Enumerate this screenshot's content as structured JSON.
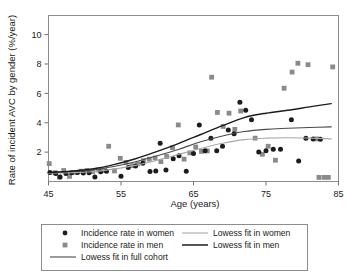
{
  "chart_data": {
    "type": "scatter",
    "title": "",
    "xlabel": "Age (years)",
    "ylabel": "Rate of incident AVC by gender (%/year)",
    "xlim": [
      45,
      85
    ],
    "ylim": [
      0,
      11.3
    ],
    "xticks": [
      45,
      55,
      65,
      75,
      85
    ],
    "yticks": [
      2,
      4,
      6,
      8,
      10
    ],
    "xtick_labels": [
      "45",
      "55",
      "65",
      "75",
      "85"
    ],
    "ytick_labels": [
      "2",
      "4",
      "6",
      "8",
      "10"
    ],
    "grid": false,
    "legend_position": "below-plot",
    "colors": {
      "women_marker": "#1c1c1c",
      "men_marker": "#8a8a8a",
      "women_fit": "#a9a9a9",
      "men_fit": "#1c1c1c",
      "full_cohort_fit": "#4a4a4a",
      "frame": "#8c8c93",
      "background": "#ffffff"
    },
    "series": [
      {
        "name": "Incidence rate in women",
        "type": "scatter",
        "marker": "circle",
        "color": "#1c1c1c",
        "points": [
          [
            45.2,
            0.62
          ],
          [
            46.0,
            0.55
          ],
          [
            46.6,
            0.3
          ],
          [
            47.4,
            0.55
          ],
          [
            48.2,
            0.6
          ],
          [
            49.0,
            0.62
          ],
          [
            49.8,
            0.58
          ],
          [
            50.6,
            0.6
          ],
          [
            51.4,
            0.3
          ],
          [
            52.2,
            0.66
          ],
          [
            53.0,
            0.7
          ],
          [
            55.0,
            0.35
          ],
          [
            56.0,
            0.95
          ],
          [
            57.0,
            1.05
          ],
          [
            58.0,
            1.25
          ],
          [
            59.0,
            0.68
          ],
          [
            59.8,
            0.72
          ],
          [
            60.4,
            2.6
          ],
          [
            61.2,
            0.78
          ],
          [
            62.2,
            1.55
          ],
          [
            63.0,
            1.75
          ],
          [
            64.0,
            0.7
          ],
          [
            65.0,
            1.9
          ],
          [
            65.8,
            3.85
          ],
          [
            66.6,
            2.1
          ],
          [
            67.4,
            2.95
          ],
          [
            68.2,
            2.1
          ],
          [
            69.0,
            2.4
          ],
          [
            69.8,
            3.5
          ],
          [
            70.6,
            3.25
          ],
          [
            71.4,
            5.4
          ],
          [
            72.2,
            4.85
          ],
          [
            73.0,
            4.2
          ],
          [
            74.0,
            2.0
          ],
          [
            75.0,
            2.1
          ],
          [
            76.0,
            2.2
          ],
          [
            77.0,
            2.2
          ],
          [
            78.5,
            4.2
          ],
          [
            79.5,
            1.4
          ],
          [
            80.5,
            2.95
          ],
          [
            81.5,
            2.9
          ],
          [
            82.5,
            2.88
          ]
        ]
      },
      {
        "name": "Incidence rate in men",
        "type": "scatter",
        "marker": "square",
        "color": "#8a8a8a",
        "points": [
          [
            45.1,
            1.22
          ],
          [
            45.9,
            0.6
          ],
          [
            46.5,
            0.3
          ],
          [
            47.1,
            0.75
          ],
          [
            47.9,
            0.35
          ],
          [
            48.7,
            0.62
          ],
          [
            49.5,
            0.7
          ],
          [
            50.3,
            0.75
          ],
          [
            51.1,
            0.68
          ],
          [
            51.9,
            0.78
          ],
          [
            52.7,
            0.75
          ],
          [
            53.3,
            2.4
          ],
          [
            54.1,
            0.72
          ],
          [
            54.9,
            1.58
          ],
          [
            55.7,
            1.3
          ],
          [
            56.5,
            1.08
          ],
          [
            57.3,
            1.2
          ],
          [
            58.1,
            1.42
          ],
          [
            58.9,
            1.52
          ],
          [
            59.7,
            1.6
          ],
          [
            60.5,
            1.35
          ],
          [
            61.3,
            1.7
          ],
          [
            62.1,
            2.3
          ],
          [
            62.9,
            3.85
          ],
          [
            63.7,
            1.52
          ],
          [
            64.5,
            1.95
          ],
          [
            65.3,
            2.35
          ],
          [
            66.1,
            2.05
          ],
          [
            66.9,
            2.08
          ],
          [
            67.5,
            7.1
          ],
          [
            68.3,
            4.7
          ],
          [
            69.1,
            3.75
          ],
          [
            69.9,
            4.65
          ],
          [
            70.7,
            3.55
          ],
          [
            71.5,
            4.8
          ],
          [
            73.5,
            2.95
          ],
          [
            74.5,
            1.85
          ],
          [
            75.3,
            2.4
          ],
          [
            76.3,
            1.45
          ],
          [
            77.5,
            6.35
          ],
          [
            78.6,
            7.45
          ],
          [
            79.4,
            8.05
          ],
          [
            80.8,
            7.95
          ],
          [
            82.0,
            2.9
          ],
          [
            82.3,
            0.28
          ],
          [
            83.0,
            0.28
          ],
          [
            83.6,
            0.28
          ],
          [
            84.2,
            7.8
          ]
        ]
      },
      {
        "name": "Lowess fit in women",
        "type": "line",
        "color": "#a9a9a9",
        "points": [
          [
            45,
            0.58
          ],
          [
            48,
            0.6
          ],
          [
            51,
            0.66
          ],
          [
            54,
            0.85
          ],
          [
            57,
            1.1
          ],
          [
            60,
            1.45
          ],
          [
            63,
            1.85
          ],
          [
            66,
            2.25
          ],
          [
            69,
            2.6
          ],
          [
            72,
            2.85
          ],
          [
            75,
            2.95
          ],
          [
            78,
            2.98
          ],
          [
            81,
            2.95
          ],
          [
            84,
            2.9
          ]
        ]
      },
      {
        "name": "Lowess fit in men",
        "type": "line",
        "color": "#1c1c1c",
        "points": [
          [
            45,
            0.62
          ],
          [
            48,
            0.7
          ],
          [
            51,
            0.85
          ],
          [
            54,
            1.15
          ],
          [
            57,
            1.55
          ],
          [
            60,
            2.05
          ],
          [
            63,
            2.6
          ],
          [
            66,
            3.2
          ],
          [
            69,
            3.8
          ],
          [
            72,
            4.35
          ],
          [
            75,
            4.65
          ],
          [
            78,
            4.85
          ],
          [
            81,
            5.08
          ],
          [
            84,
            5.3
          ]
        ]
      },
      {
        "name": "Lowess fit in full cohort",
        "type": "line",
        "color": "#4a4a4a",
        "points": [
          [
            45,
            0.6
          ],
          [
            48,
            0.66
          ],
          [
            51,
            0.78
          ],
          [
            54,
            1.02
          ],
          [
            57,
            1.35
          ],
          [
            60,
            1.75
          ],
          [
            63,
            2.2
          ],
          [
            66,
            2.7
          ],
          [
            69,
            3.1
          ],
          [
            72,
            3.4
          ],
          [
            75,
            3.55
          ],
          [
            78,
            3.62
          ],
          [
            81,
            3.68
          ],
          [
            84,
            3.72
          ]
        ]
      }
    ]
  },
  "axes": {
    "y_title": "Rate of incident AVC by gender (%/year)",
    "x_title": "Age (years)"
  },
  "legend": {
    "entries": [
      {
        "label": "Incidence rate in women",
        "glyph": "circle-marker",
        "color": "#1c1c1c"
      },
      {
        "label": "Lowess fit in women",
        "glyph": "line-swatch",
        "color": "#a9a9a9"
      },
      {
        "label": "Incidence rate in men",
        "glyph": "square-marker",
        "color": "#8a8a8a"
      },
      {
        "label": "Lowess fit in men",
        "glyph": "line-swatch",
        "color": "#1c1c1c"
      },
      {
        "label": "Lowess fit in full cohort",
        "glyph": "line-swatch",
        "color": "#4a4a4a"
      }
    ]
  }
}
